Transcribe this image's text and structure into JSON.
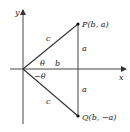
{
  "diagram": {
    "type": "coordinate-geometry",
    "axes": {
      "x_label": "x",
      "y_label": "y"
    },
    "points": {
      "P": {
        "label": "P(b, a)",
        "name": "P",
        "coords": "(b, a)"
      },
      "Q": {
        "label": "Q(b, −a)",
        "name": "Q",
        "coords": "(b, −a)"
      }
    },
    "segments": {
      "OP_label": "c",
      "OQ_label": "c",
      "upper_vertical_label": "a",
      "lower_vertical_label": "a",
      "base_label": "b"
    },
    "angles": {
      "upper": "θ",
      "lower": "−θ"
    },
    "colors": {
      "line": "#333333",
      "text": "#222222",
      "background": "#ffffff"
    }
  }
}
